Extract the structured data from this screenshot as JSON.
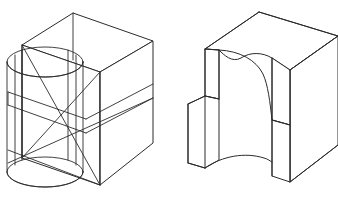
{
  "document": {
    "type": "engineering-drawing",
    "title": "Isometric pictorial views",
    "background_color": "#ffffff",
    "line_color": "#2b2b2b",
    "width": 338,
    "height": 198,
    "figure_count": 2
  },
  "figures": [
    {
      "id": "left-figure",
      "name": "wireframe-box-with-cylinder",
      "description": "Transparent isometric rectangular box showing an inscribed vertical cylinder and internal horizontal cross-section planes",
      "elements": [
        "box-top-face",
        "box-front-left-face",
        "box-front-right-face",
        "cylinder-top-ellipse",
        "cylinder-bottom-ellipse",
        "cylinder-side-elements",
        "internal-section-planes"
      ]
    },
    {
      "id": "right-figure",
      "name": "solid-block-with-curved-notch",
      "description": "Isometric solid block with a concave cylindrical notch cut into the front face forming a U-shaped recess",
      "elements": [
        "block-top-face",
        "block-right-face",
        "left-post",
        "right-post",
        "concave-cut-surface",
        "notch-shoulder"
      ]
    }
  ],
  "geometry": {
    "left": {
      "box_top_vertex": [
        73,
        13
      ],
      "box_left_vertex": [
        22,
        45
      ],
      "box_right_vertex": [
        153,
        41
      ],
      "box_front_vertex": [
        100,
        72
      ],
      "box_bottom_front": [
        100,
        185
      ],
      "box_bottom_left": [
        22,
        158
      ],
      "box_bottom_right": [
        153,
        143
      ],
      "cylinder_center_x": 45,
      "cylinder_rx": 38,
      "cylinder_ry": 15,
      "cylinder_top_cy": 62,
      "cylinder_bottom_cy": 172
    },
    "right": {
      "top_vertex": [
        259,
        12
      ],
      "top_left_vertex": [
        205,
        49
      ],
      "top_right_vertex": [
        338,
        36
      ],
      "notch_left_x": 219,
      "notch_right_x": 272,
      "block_bottom_y": 182
    }
  },
  "colors": {
    "stroke": "#2b2b2b",
    "fill": "#ffffff",
    "page": "#ffffff"
  }
}
